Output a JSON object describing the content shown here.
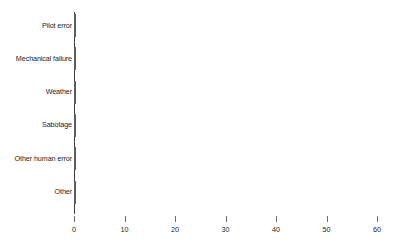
{
  "chart_data": {
    "type": "bar",
    "orientation": "horizontal",
    "title": "",
    "subtitle": "",
    "xlabel": "",
    "ylabel": "",
    "categories": [
      "Pilot error",
      "Mechanical failure",
      "Weather",
      "Sabotage",
      "Other human error",
      "Other"
    ],
    "values": [
      50,
      22,
      12,
      9,
      7,
      1
    ],
    "xlim": [
      0,
      60
    ],
    "xticks": [
      0,
      10,
      20,
      30,
      40,
      50,
      60
    ],
    "xtick_labels": [
      "0",
      "10",
      "20",
      "30",
      "40",
      "50",
      "60"
    ],
    "grid": false,
    "legend": null,
    "legend_position": "none",
    "annotations": [],
    "colors": {
      "bar_fill": "#9d9d9d",
      "bar_border": "#5e5e5e",
      "axis": "#3d3d3d",
      "tick": "#6b6b6b",
      "text": "#1c1c1c",
      "background": "#ffffff"
    }
  }
}
